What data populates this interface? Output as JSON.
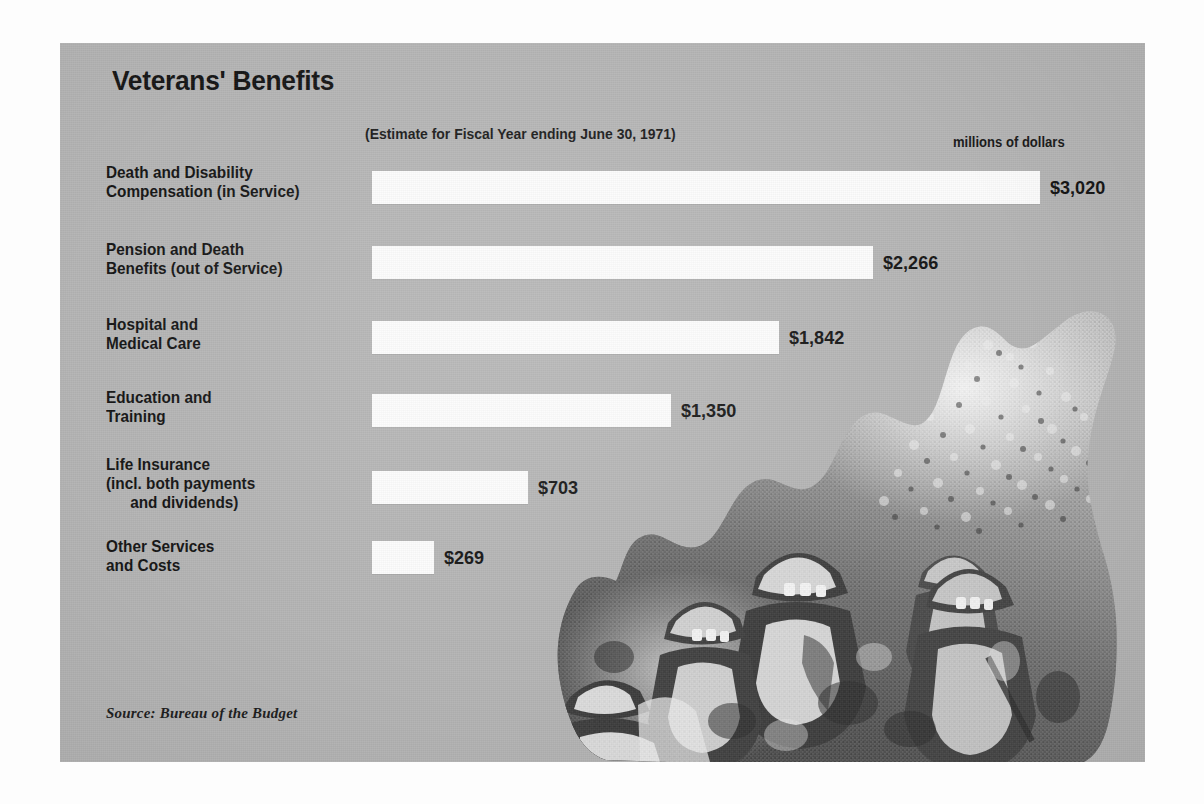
{
  "poster": {
    "title": "Veterans' Benefits",
    "subtitle": "(Estimate for Fiscal Year ending June 30, 1971)",
    "units_label": "millions of dollars",
    "source": "Source: Bureau of the Budget",
    "photo_caption": "black-and-white cut-out photograph of a column of helmeted soldiers",
    "colors": {
      "page_background": "#fdfdfd",
      "card_background": "#b4b4b4",
      "bar_fill": "#fcfcfc",
      "text": "#131313"
    }
  },
  "chart_data": {
    "type": "bar",
    "orientation": "horizontal",
    "title": "Veterans' Benefits",
    "subtitle": "(Estimate for Fiscal Year ending June 30, 1971)",
    "xlabel": "millions of dollars",
    "ylabel": "",
    "units": "millions of dollars",
    "grid": false,
    "legend": "none",
    "xlim": [
      0,
      3020
    ],
    "categories": [
      "Death and Disability Compensation (in Service)",
      "Pension and Death Benefits (out of Service)",
      "Hospital and Medical Care",
      "Education and Training",
      "Life Insurance (incl. both payments and dividends)",
      "Other Services and Costs"
    ],
    "values": [
      3020,
      2266,
      1842,
      1350,
      703,
      269
    ],
    "value_labels": [
      "$3,020",
      "$2,266",
      "$1,842",
      "$1,350",
      "$703",
      "$269"
    ],
    "source": "Source: Bureau of the Budget"
  },
  "rows": [
    {
      "label_lines": [
        "Death and Disability",
        "Compensation (in Service)"
      ],
      "value": 3020,
      "value_label": "$3,020",
      "label_top": 120,
      "bar_top": 128,
      "bar_width": 668
    },
    {
      "label_lines": [
        "Pension and Death",
        "Benefits (out of Service)"
      ],
      "value": 2266,
      "value_label": "$2,266",
      "label_top": 197,
      "bar_top": 203,
      "bar_width": 501
    },
    {
      "label_lines": [
        "Hospital and",
        "Medical Care"
      ],
      "value": 1842,
      "value_label": "$1,842",
      "label_top": 272,
      "bar_top": 278,
      "bar_width": 407
    },
    {
      "label_lines": [
        "Education and",
        "Training"
      ],
      "value": 1350,
      "value_label": "$1,350",
      "label_top": 345,
      "bar_top": 351,
      "bar_width": 299
    },
    {
      "label_lines": [
        "Life Insurance",
        "(incl. both payments",
        "and dividends)"
      ],
      "value": 703,
      "value_label": "$703",
      "label_top": 412,
      "bar_top": 428,
      "bar_width": 156
    },
    {
      "label_lines": [
        "Other Services",
        "and Costs"
      ],
      "value": 269,
      "value_label": "$269",
      "label_top": 494,
      "bar_top": 498,
      "bar_width": 62
    }
  ]
}
